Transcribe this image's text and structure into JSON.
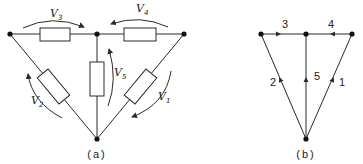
{
  "figure_a": {
    "caption": "(a)",
    "labels": {
      "v1": {
        "main": "V",
        "sub": "1"
      },
      "v2": {
        "main": "V",
        "sub": "2"
      },
      "v3": {
        "main": "V",
        "sub": "3"
      },
      "v4": {
        "main": "V",
        "sub": "4"
      },
      "v5": {
        "main": "V",
        "sub": "5"
      }
    }
  },
  "figure_b": {
    "caption": "(b)",
    "edges": {
      "e1": "1",
      "e2": "2",
      "e3": "3",
      "e4": "4",
      "e5": "5"
    }
  },
  "colors": {
    "line": "#2a2a2a",
    "node": "#111111",
    "background": "#ffffff"
  }
}
